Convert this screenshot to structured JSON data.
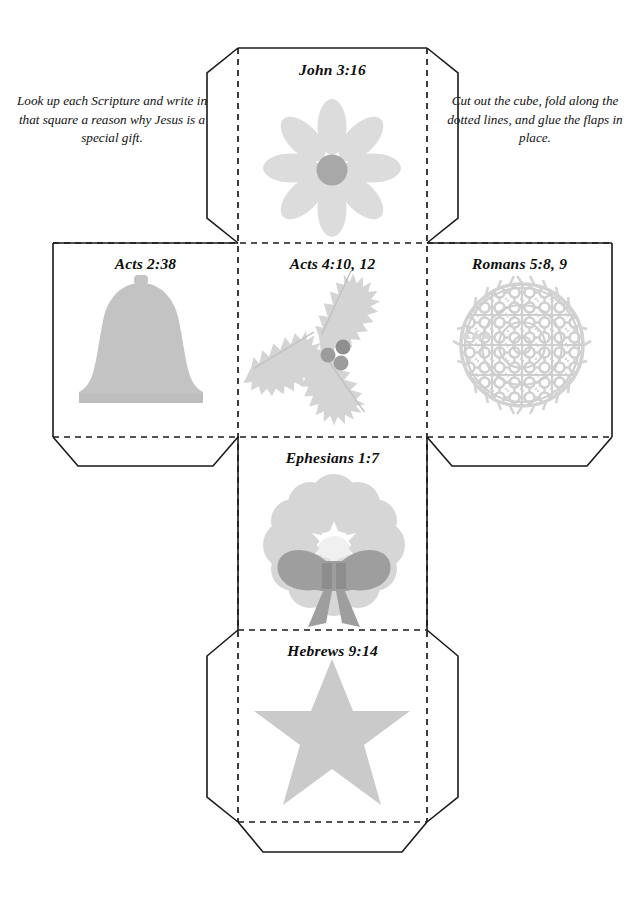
{
  "page": {
    "background_color": "#ffffff",
    "line_color": "#1a1a1a",
    "width": 643,
    "height": 898
  },
  "instructions": {
    "left": "Look up each Scripture and write in that square a reason why Jesus is a special gift.",
    "right": "Cut out the cube, fold along the dotted lines, and glue the flaps in place."
  },
  "cube_faces": [
    {
      "id": "top",
      "label": "John 3:16",
      "illustration": "flower-icon",
      "position": "top-center"
    },
    {
      "id": "left",
      "label": "Acts 2:38",
      "illustration": "bell-icon",
      "position": "middle-left"
    },
    {
      "id": "center",
      "label": "Acts 4:10, 12",
      "illustration": "holly-icon",
      "position": "middle-center"
    },
    {
      "id": "right",
      "label": "Romans 5:8, 9",
      "illustration": "ornament-ball-icon",
      "position": "middle-right"
    },
    {
      "id": "lower",
      "label": "Ephesians 1:7",
      "illustration": "wreath-icon",
      "position": "lower-center"
    },
    {
      "id": "bottom",
      "label": "Hebrews 9:14",
      "illustration": "star-icon",
      "position": "bottom-center"
    }
  ],
  "colors": {
    "art_light": "#d7d7d7",
    "art_mid": "#c9c9c9",
    "art_dark": "#a3a3a3",
    "art_darker": "#949494",
    "outline": "#1a1a1a",
    "paper": "#ffffff"
  }
}
